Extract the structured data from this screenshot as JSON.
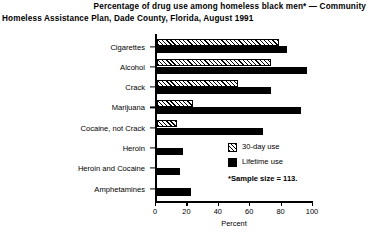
{
  "title": {
    "line1": "Percentage of drug use among homeless black men* — Community",
    "line2": "Homeless Assistance Plan, Dade County, Florida, August 1991"
  },
  "legend": {
    "items": [
      {
        "label": "30-day use",
        "swatch": "hatched"
      },
      {
        "label": "Lifetime use",
        "swatch": "solid-black"
      }
    ]
  },
  "footnote": "*Sample size = 113.",
  "chart_data": {
    "type": "bar",
    "orientation": "horizontal",
    "title": "Percentage of drug use among homeless black men* — Community Homeless Assistance Plan, Dade County, Florida, August 1991",
    "xlabel": "Percent",
    "ylabel": "",
    "xlim": [
      0,
      100
    ],
    "xticks": [
      0,
      20,
      40,
      60,
      80,
      100
    ],
    "xtick_labels": [
      "0",
      "20",
      "40",
      "60",
      "80",
      "100"
    ],
    "grid": false,
    "legend_position": "right-middle",
    "categories": [
      "Cigarettes",
      "Alcohol",
      "Crack",
      "Marijuana",
      "Cocaine, not Crack",
      "Heroin",
      "Heroin and Cocaine",
      "Amphetamines"
    ],
    "series": [
      {
        "name": "30-day use",
        "values": [
          78,
          73,
          52,
          23,
          13,
          0,
          0,
          0
        ]
      },
      {
        "name": "Lifetime use",
        "values": [
          83,
          96,
          73,
          92,
          68,
          17,
          15,
          22
        ]
      }
    ],
    "annotations": [
      "*Sample size = 113."
    ]
  }
}
